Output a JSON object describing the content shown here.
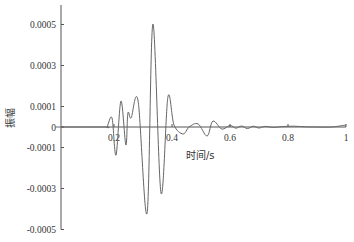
{
  "chart_data": {
    "type": "line",
    "title": "",
    "xlabel": "时间/s",
    "ylabel": "振幅",
    "xlim": [
      0,
      1
    ],
    "ylim": [
      -0.0005,
      0.0005
    ],
    "x_ticks": [
      0.2,
      0.4,
      0.6,
      0.8,
      1
    ],
    "x_tick_labels": [
      "0.2",
      "0.4",
      "0.6",
      "0.8",
      "1"
    ],
    "y_ticks": [
      0.0005,
      0.0003,
      0.0001,
      0,
      -0.0001,
      -0.0003,
      -0.0005
    ],
    "y_tick_labels": [
      "0.0005",
      "0.0003",
      "0.0001",
      "0",
      "-0.0001",
      "-0.0003",
      "-0.0005"
    ],
    "grid": false,
    "legend": null,
    "series": [
      {
        "name": "振幅",
        "color": "#666666",
        "x": [
          0,
          0.17,
          0.176,
          0.193,
          0.207,
          0.224,
          0.241,
          0.248,
          0.259,
          0.283,
          0.314,
          0.334,
          0.362,
          0.386,
          0.407,
          0.438,
          0.459,
          0.49,
          0.521,
          0.541,
          0.572,
          0.6,
          0.62,
          0.64,
          0.66,
          0.68,
          0.7,
          0.72,
          0.75,
          0.78,
          0.82,
          0.86,
          0.9,
          0.95,
          1.0
        ],
        "y": [
          0,
          0,
          0,
          4.4e-05,
          -0.000137,
          0.000127,
          -8.8e-05,
          6.8e-05,
          4.4e-05,
          0.000127,
          -0.00042,
          0.000502,
          -0.000322,
          0.000146,
          1e-05,
          -3.4e-05,
          0,
          1.5e-05,
          -4.4e-05,
          2.9e-05,
          -1e-05,
          8e-06,
          -6e-06,
          5e-06,
          -8e-06,
          4e-06,
          -5e-06,
          3e-06,
          -2e-06,
          2e-06,
          4e-06,
          1e-06,
          0,
          0,
          1e-05
        ]
      }
    ]
  }
}
